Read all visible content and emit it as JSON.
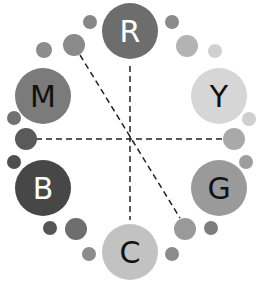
{
  "diagram": {
    "title": "",
    "primaries": [
      {
        "id": "R",
        "label": "R",
        "color": "#6d6d6d",
        "text_color": "#ffffff"
      },
      {
        "id": "Y",
        "label": "Y",
        "color": "#d6d6d6",
        "text_color": "#111111"
      },
      {
        "id": "G",
        "label": "G",
        "color": "#9a9a9a",
        "text_color": "#111111"
      },
      {
        "id": "C",
        "label": "C",
        "color": "#c2c2c2",
        "text_color": "#111111"
      },
      {
        "id": "B",
        "label": "B",
        "color": "#474747",
        "text_color": "#ffffff"
      },
      {
        "id": "M",
        "label": "M",
        "color": "#7b7b7b",
        "text_color": "#111111"
      }
    ],
    "secondary_dot_colors": {
      "R_Y_inner": "#b3b3b3",
      "R_Y_outer": "#8a8a8a",
      "Y_far": "#d0d0d0",
      "Y_G_a": "#cfcfcf",
      "Y_G_mid": "#a9a9a9",
      "Y_G_b": "#9e9e9e",
      "G_C_a": "#7d7d7d",
      "G_C_mid": "#999999",
      "G_C_b": "#8c8c8c",
      "C_B_a": "#8c8c8c",
      "C_B_mid": "#6e6e6e",
      "C_B_b": "#555555",
      "B_M_a": "#4f4f4f",
      "B_M_mid": "#5a5a5a",
      "B_M_b": "#717171",
      "M_R_a": "#8c8c8c",
      "M_R_mid": "#8a8a8a",
      "M_R_b": "#878787"
    },
    "connections": [
      {
        "from": "R",
        "to": "C",
        "style": "dashed"
      },
      {
        "from": "B_M_mid",
        "to": "Y_G_mid",
        "style": "dashed"
      },
      {
        "from": "M_R_mid",
        "to": "G_C_mid",
        "style": "dashed"
      }
    ]
  }
}
